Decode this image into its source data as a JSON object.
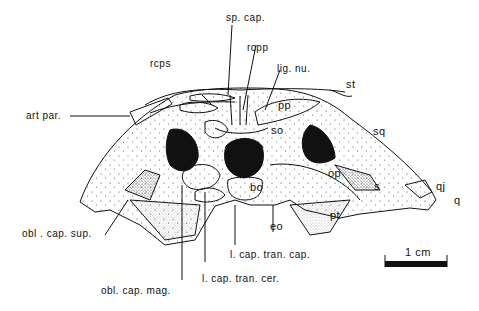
{
  "figure": {
    "view": "skull posterior view",
    "scale_bar": {
      "label": "1 cm"
    },
    "labels": {
      "sp_cap": "sp. cap.",
      "rcps": "rcps",
      "rcpp": "rcpp",
      "lig_nu": "lig. nu.",
      "st": "st",
      "art_par": "art  par.",
      "pp": "pp",
      "so": "so",
      "sq": "sq",
      "op": "op",
      "bo": "bo",
      "s": "s",
      "qj": "qj",
      "q": "q",
      "eo": "eo",
      "pt": "pt",
      "obl_cap_sup": "obl . cap. sup.",
      "l_cap_tran_cap": "l. cap. tran. cap.",
      "l_cap_tran_cer": "l. cap. tran. cer.",
      "obl_cap_mag": "obl. cap. mag."
    }
  }
}
